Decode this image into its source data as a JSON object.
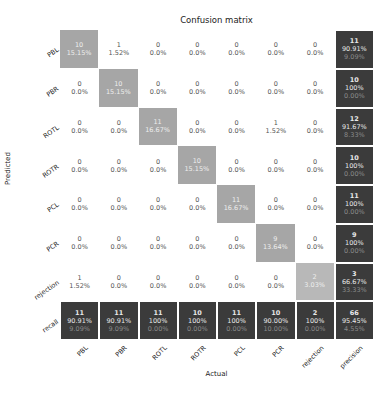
{
  "chart_data": {
    "type": "heatmap",
    "title": "Confusion matrix",
    "xlabel": "Actual",
    "ylabel": "Predicted",
    "categories": [
      "PBL",
      "PBR",
      "ROTL",
      "ROTR",
      "PCL",
      "PCR",
      "rejection"
    ],
    "x_tick_labels": [
      "PBL",
      "PBR",
      "ROTL",
      "ROTR",
      "PCL",
      "PCR",
      "rejection",
      "precision"
    ],
    "y_tick_labels": [
      "PBL",
      "PBR",
      "ROTL",
      "ROTR",
      "PCL",
      "PCR",
      "rejection",
      "recall"
    ],
    "matrix": [
      [
        10,
        1,
        0,
        0,
        0,
        0,
        0
      ],
      [
        0,
        10,
        0,
        0,
        0,
        0,
        0
      ],
      [
        0,
        0,
        11,
        0,
        0,
        1,
        0
      ],
      [
        0,
        0,
        0,
        10,
        0,
        0,
        0
      ],
      [
        0,
        0,
        0,
        0,
        11,
        0,
        0
      ],
      [
        0,
        0,
        0,
        0,
        0,
        9,
        0
      ],
      [
        1,
        0,
        0,
        0,
        0,
        0,
        2
      ]
    ],
    "matrix_pct": [
      [
        "15.15%",
        "1.52%",
        "0.0%",
        "0.0%",
        "0.0%",
        "0.0%",
        "0.0%"
      ],
      [
        "0.0%",
        "15.15%",
        "0.0%",
        "0.0%",
        "0.0%",
        "0.0%",
        "0.0%"
      ],
      [
        "0.0%",
        "0.0%",
        "16.67%",
        "0.0%",
        "0.0%",
        "1.52%",
        "0.0%"
      ],
      [
        "0.0%",
        "0.0%",
        "0.0%",
        "15.15%",
        "0.0%",
        "0.0%",
        "0.0%"
      ],
      [
        "0.0%",
        "0.0%",
        "0.0%",
        "0.0%",
        "16.67%",
        "0.0%",
        "0.0%"
      ],
      [
        "0.0%",
        "0.0%",
        "0.0%",
        "0.0%",
        "0.0%",
        "13.64%",
        "0.0%"
      ],
      [
        "1.52%",
        "0.0%",
        "0.0%",
        "0.0%",
        "0.0%",
        "0.0%",
        "3.03%"
      ]
    ],
    "precision": [
      {
        "count": 11,
        "pct": "90.91%",
        "err": "9.09%"
      },
      {
        "count": 10,
        "pct": "100%",
        "err": "0.00%"
      },
      {
        "count": 12,
        "pct": "91.67%",
        "err": "8.33%"
      },
      {
        "count": 10,
        "pct": "100%",
        "err": "0.00%"
      },
      {
        "count": 11,
        "pct": "100%",
        "err": "0.00%"
      },
      {
        "count": 9,
        "pct": "100%",
        "err": "0.00%"
      },
      {
        "count": 3,
        "pct": "66.67%",
        "err": "33.33%"
      }
    ],
    "recall": [
      {
        "count": 11,
        "pct": "90.91%",
        "err": "9.09%"
      },
      {
        "count": 11,
        "pct": "90.91%",
        "err": "9.09%"
      },
      {
        "count": 11,
        "pct": "100%",
        "err": "0.00%"
      },
      {
        "count": 10,
        "pct": "100%",
        "err": "0.00%"
      },
      {
        "count": 11,
        "pct": "100%",
        "err": "0.00%"
      },
      {
        "count": 10,
        "pct": "90.00%",
        "err": "10.00%"
      },
      {
        "count": 2,
        "pct": "100%",
        "err": "0.00%"
      }
    ],
    "overall": {
      "count": 66,
      "pct": "95.45%",
      "err": "4.55%"
    },
    "colors": {
      "diagonal": "#a6a6a6",
      "summary": "#3b3b3b",
      "background": "#ffffff"
    }
  }
}
